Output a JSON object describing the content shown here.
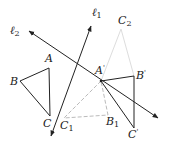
{
  "diagram": {
    "type": "geometry-reflection",
    "colors": {
      "ink": "#222222",
      "dashed": "#bbbbbb",
      "faint": "#dddddd"
    },
    "lines": [
      {
        "id": "l2",
        "label_base": "ℓ",
        "label_sub": "2",
        "from": [
          29,
          31
        ],
        "to": [
          158,
          118
        ]
      },
      {
        "id": "l1",
        "label_base": "ℓ",
        "label_sub": "1",
        "from": [
          51,
          136
        ],
        "to": [
          91,
          26
        ]
      }
    ],
    "points": {
      "A": {
        "label": "A",
        "x": 49,
        "y": 68
      },
      "B": {
        "label": "B",
        "x": 20,
        "y": 81
      },
      "C": {
        "label": "C",
        "x": 50,
        "y": 116
      },
      "A_prime": {
        "label": "A",
        "mark": "'",
        "x": 101,
        "y": 81
      },
      "B_prime": {
        "label": "B",
        "mark": "'",
        "x": 134,
        "y": 76
      },
      "C_prime": {
        "label": "C",
        "mark": "'",
        "x": 134,
        "y": 128
      },
      "C1": {
        "label": "C",
        "sub": "1",
        "x": 64,
        "y": 118
      },
      "B1": {
        "label": "B",
        "sub": "1",
        "x": 108,
        "y": 115
      },
      "C2": {
        "label": "C",
        "sub": "2",
        "x": 121,
        "y": 29
      }
    }
  }
}
